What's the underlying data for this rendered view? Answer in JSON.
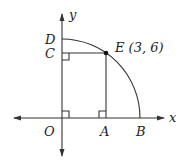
{
  "diagram": {
    "axis_labels": {
      "x": "x",
      "y": "y"
    },
    "points": {
      "O": "O",
      "A": "A",
      "B": "B",
      "C": "C",
      "D": "D",
      "E": "E (3, 6)"
    },
    "point_E_coordinates": [
      3,
      6
    ]
  }
}
